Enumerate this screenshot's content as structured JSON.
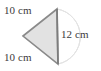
{
  "figure": {
    "type": "geometry-diagram",
    "shape": "triangle",
    "orientation": "apex-left",
    "background_color": "#ffffff",
    "fill_color": "#e2e2e2",
    "stroke_color": "#8a8a8a",
    "arc_color": "#dcdcdc",
    "label_color": "#3b3b3b",
    "vertices": {
      "apex_left": [
        23,
        36
      ],
      "top_right": [
        57,
        9
      ],
      "bottom_right": [
        58,
        64
      ]
    },
    "labels": {
      "top_side": "10 cm",
      "bottom_side": "10 cm",
      "right_side": "12 cm"
    },
    "measurements": [
      {
        "side": "upper-left",
        "value": 10,
        "unit": "cm",
        "text": "10 cm"
      },
      {
        "side": "lower-left",
        "value": 10,
        "unit": "cm",
        "text": "10 cm"
      },
      {
        "side": "right-vertical",
        "value": 12,
        "unit": "cm",
        "text": "12 cm"
      }
    ]
  }
}
